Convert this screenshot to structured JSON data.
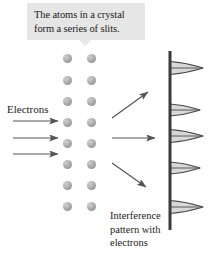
{
  "figure": {
    "background_color": "#ffffff"
  },
  "callout": {
    "name": "crystal-slits-callout",
    "background_color": "#e6e6e6",
    "text_color": "#1a1a1a",
    "line1": "The atoms in a crystal",
    "line2": "form a series of slits."
  },
  "labels": {
    "electrons": "Electrons",
    "interference_line1": "Interference",
    "interference_line2": "pattern with",
    "interference_line3": "electrons"
  },
  "lattice": {
    "name": "crystal-atom-lattice",
    "columns_x": [
      67,
      91
    ],
    "rows_y": [
      58,
      80,
      101,
      122,
      143,
      164,
      185,
      206
    ],
    "atom_diameter": 9,
    "atom_color": "#a8a8a8",
    "atom_count": 16
  },
  "incoming_beams": {
    "name": "incident-electron-arrows",
    "color": "#555555",
    "arrows": [
      {
        "x1": 13,
        "y1": 121,
        "x2": 58,
        "y2": 121
      },
      {
        "x1": 13,
        "y1": 138,
        "x2": 58,
        "y2": 138
      },
      {
        "x1": 13,
        "y1": 154,
        "x2": 58,
        "y2": 154
      }
    ]
  },
  "diffracted_beams": {
    "name": "diffracted-electron-arrows",
    "color": "#555555",
    "arrows": [
      {
        "x1": 112,
        "y1": 118,
        "x2": 148,
        "y2": 92,
        "direction": "up-right"
      },
      {
        "x1": 112,
        "y1": 138,
        "x2": 155,
        "y2": 138,
        "direction": "right"
      },
      {
        "x1": 112,
        "y1": 163,
        "x2": 146,
        "y2": 187,
        "direction": "down-right"
      }
    ]
  },
  "screen": {
    "name": "detection-screen",
    "x": 170,
    "y_top": 51,
    "y_bottom": 230,
    "color": "#3a3a3a",
    "thickness": 3
  },
  "chart_data": {
    "type": "line",
    "title": "Interference pattern with electrons",
    "xlabel": "Intensity",
    "ylabel": "Position on screen",
    "orientation": "horizontal-peaks-on-vertical-axis",
    "grid": false,
    "axis_x": 170,
    "peak_color": "#4a4a4a",
    "peak_fill": "#d8d8d8",
    "peaks": [
      {
        "y": 68,
        "height": 13,
        "width": 33,
        "label": "peak-1"
      },
      {
        "y": 110,
        "height": 12,
        "width": 30,
        "label": "peak-2"
      },
      {
        "y": 136,
        "height": 13,
        "width": 33,
        "label": "peak-3"
      },
      {
        "y": 168,
        "height": 12,
        "width": 30,
        "label": "peak-4"
      },
      {
        "y": 207,
        "height": 13,
        "width": 33,
        "label": "peak-5"
      }
    ]
  }
}
